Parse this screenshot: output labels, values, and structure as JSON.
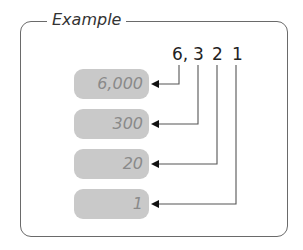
{
  "title": "Example",
  "number": {
    "digits": [
      "6,",
      "3",
      "2",
      "1"
    ]
  },
  "place_values": [
    {
      "label": "6,000"
    },
    {
      "label": "300"
    },
    {
      "label": "20"
    },
    {
      "label": "1"
    }
  ],
  "colors": {
    "frame": "#6a6a6a",
    "pill_bg": "#c9c9c9",
    "pill_text": "#8a8a8a",
    "line": "#555555",
    "arrow": "#111111"
  }
}
